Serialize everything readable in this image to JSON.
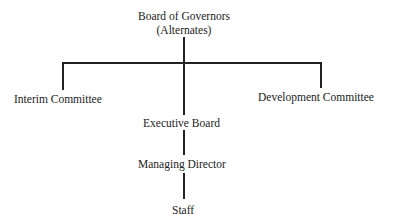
{
  "diagram": {
    "type": "org-chart",
    "nodes": {
      "board": {
        "line1": "Board of Governors",
        "line2": "(Alternates)"
      },
      "interim": {
        "label": "Interim Committee"
      },
      "development": {
        "label": "Development Committee"
      },
      "executive": {
        "label": "Executive Board"
      },
      "managing": {
        "label": "Managing Director"
      },
      "staff": {
        "label": "Staff"
      }
    },
    "edges": [
      [
        "Board of Governors",
        "Interim Committee"
      ],
      [
        "Board of Governors",
        "Development Committee"
      ],
      [
        "Board of Governors",
        "Executive Board"
      ],
      [
        "Executive Board",
        "Managing Director"
      ],
      [
        "Managing Director",
        "Staff"
      ]
    ]
  }
}
